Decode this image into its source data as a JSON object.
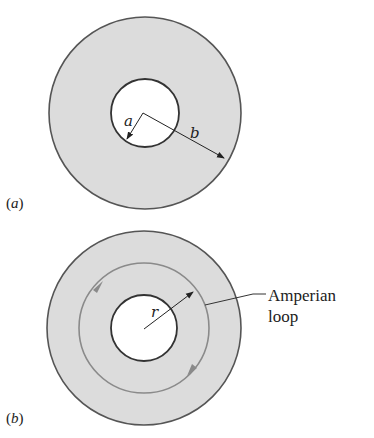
{
  "figure_a": {
    "caption": "(a)",
    "center": [
      145,
      113
    ],
    "outer_radius": 96,
    "inner_radius": 34,
    "label_a": "a",
    "label_b": "b"
  },
  "figure_b": {
    "caption": "(b)",
    "center": [
      144,
      328
    ],
    "outer_radius": 97,
    "inner_radius": 33,
    "loop_radius": 65,
    "label_r": "r",
    "callout_line1": "Amperian",
    "callout_line2": "loop"
  },
  "colors": {
    "ring_fill": "#dcdcdc",
    "ring_stroke": "#555555",
    "loop_stroke": "#8a8a8a",
    "arrow": "#222222",
    "loop_arrow": "#8a8a8a"
  }
}
